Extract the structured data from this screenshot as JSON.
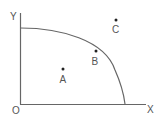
{
  "diagram": {
    "type": "production-possibilities-frontier",
    "axes": {
      "y_label": "Y",
      "x_label": "X",
      "origin_label": "O"
    },
    "points": [
      {
        "label": "A",
        "x": 63,
        "y": 69,
        "position": "inside frontier"
      },
      {
        "label": "B",
        "x": 96,
        "y": 51,
        "position": "on frontier"
      },
      {
        "label": "C",
        "x": 116,
        "y": 20,
        "position": "outside frontier"
      }
    ],
    "colors": {
      "axis": "#666666",
      "curve": "#666666",
      "point": "#222222",
      "label": "#555555"
    }
  }
}
